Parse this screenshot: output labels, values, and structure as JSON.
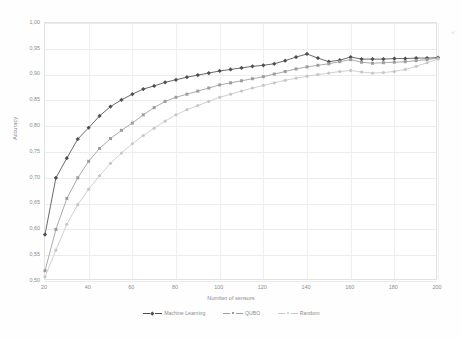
{
  "chart_data": {
    "type": "line",
    "title": "",
    "xlabel": "Number of sensors",
    "ylabel": "Accuracy",
    "xlim": [
      20,
      200
    ],
    "ylim": [
      0.5,
      1.0
    ],
    "xticks": [
      20,
      40,
      60,
      80,
      100,
      120,
      140,
      160,
      180,
      200
    ],
    "yticks": [
      "0,50",
      "0,55",
      "0,60",
      "0,65",
      "0,70",
      "0,75",
      "0,80",
      "0,85",
      "0,90",
      "0,95",
      "1,00"
    ],
    "ytick_values": [
      0.5,
      0.55,
      0.6,
      0.65,
      0.7,
      0.75,
      0.8,
      0.85,
      0.9,
      0.95,
      1.0
    ],
    "grid": true,
    "legend_position": "bottom",
    "decimal_separator": ",",
    "x": [
      20,
      25,
      30,
      35,
      40,
      45,
      50,
      55,
      60,
      65,
      70,
      75,
      80,
      85,
      90,
      95,
      100,
      105,
      110,
      115,
      120,
      125,
      130,
      135,
      140,
      145,
      150,
      155,
      160,
      165,
      170,
      175,
      180,
      185,
      190,
      195,
      200
    ],
    "series": [
      {
        "name": "Machine Learning",
        "color": "#4a4a4a",
        "marker": "diamond",
        "values": [
          0.59,
          0.7,
          0.738,
          0.775,
          0.797,
          0.82,
          0.838,
          0.851,
          0.862,
          0.872,
          0.878,
          0.885,
          0.89,
          0.895,
          0.899,
          0.903,
          0.907,
          0.91,
          0.913,
          0.916,
          0.918,
          0.921,
          0.927,
          0.934,
          0.94,
          0.932,
          0.925,
          0.928,
          0.934,
          0.93,
          0.93,
          0.93,
          0.931,
          0.931,
          0.932,
          0.932,
          0.933
        ]
      },
      {
        "name": "QUBO",
        "color": "#9a9a9a",
        "marker": "square",
        "values": [
          0.52,
          0.6,
          0.66,
          0.7,
          0.732,
          0.757,
          0.776,
          0.792,
          0.806,
          0.822,
          0.836,
          0.848,
          0.856,
          0.862,
          0.868,
          0.874,
          0.88,
          0.884,
          0.888,
          0.892,
          0.896,
          0.901,
          0.906,
          0.911,
          0.915,
          0.918,
          0.921,
          0.925,
          0.929,
          0.924,
          0.922,
          0.923,
          0.924,
          0.925,
          0.927,
          0.929,
          0.932
        ]
      },
      {
        "name": "Random",
        "color": "#c6c6c6",
        "marker": "circle",
        "values": [
          0.508,
          0.56,
          0.61,
          0.648,
          0.678,
          0.704,
          0.728,
          0.748,
          0.766,
          0.782,
          0.796,
          0.81,
          0.822,
          0.832,
          0.84,
          0.848,
          0.856,
          0.862,
          0.868,
          0.874,
          0.879,
          0.884,
          0.889,
          0.893,
          0.897,
          0.9,
          0.903,
          0.906,
          0.908,
          0.905,
          0.903,
          0.904,
          0.906,
          0.91,
          0.916,
          0.923,
          0.93
        ]
      }
    ]
  },
  "legend": {
    "items": [
      {
        "label": "Machine Learning"
      },
      {
        "label": "QUBO"
      },
      {
        "label": "Random"
      }
    ]
  },
  "axes": {
    "ylabel": "Accuracy",
    "xlabel": "Number of sensors"
  }
}
